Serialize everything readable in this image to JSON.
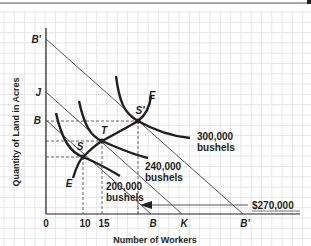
{
  "chart_data": {
    "type": "line",
    "title": "",
    "xlabel": "Number of Workers",
    "ylabel": "Quantity of Land in Acres",
    "grid": true,
    "x_tick_labels": [
      "0",
      "10",
      "15",
      "B",
      "K",
      "B'"
    ],
    "y_tick_labels": [
      "B'",
      "J",
      "B"
    ],
    "isoquants": [
      {
        "name": "200,000 bushels",
        "label_line1": "200,000",
        "label_line2": "bushels"
      },
      {
        "name": "240,000 bushels",
        "label_line1": "240,000",
        "label_line2": "bushels"
      },
      {
        "name": "300,000 bushels",
        "label_line1": "300,000",
        "label_line2": "bushels"
      }
    ],
    "isocost_lines": [
      {
        "name": "BB",
        "from": "B (land axis)",
        "to": "B (worker axis)"
      },
      {
        "name": "JK",
        "from": "J",
        "to": "K"
      },
      {
        "name": "B'B'",
        "from": "B' (land axis)",
        "to": "B' (worker axis)"
      }
    ],
    "points": [
      {
        "label": "S",
        "workers": 10
      },
      {
        "label": "T",
        "workers": 15
      },
      {
        "label": "S'"
      }
    ],
    "expansion_path_label": "E",
    "annotation": {
      "text": "$270,000",
      "arrow": "left"
    }
  },
  "labels": {
    "y_axis": "Quantity of Land in Acres",
    "x_axis": "Number of Workers",
    "origin": "0",
    "x10": "10",
    "x15": "15",
    "xB": "B",
    "xK": "K",
    "xBprime": "B'",
    "yBprime": "B'",
    "yJ": "J",
    "yB": "B",
    "pointS": "S",
    "pointT": "T",
    "pointSprime": "S'",
    "expansionTop": "E",
    "expansionBottom": "E",
    "iso300_1": "300,000",
    "iso300_2": "bushels",
    "iso240_1": "240,000",
    "iso240_2": "bushels",
    "iso200_1": "200,000",
    "iso200_2": "bushels",
    "cost": "$270,000"
  }
}
